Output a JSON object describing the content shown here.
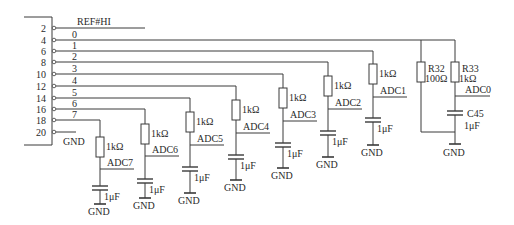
{
  "diagram": {
    "type": "circuit-schematic",
    "connector": {
      "top_label": "REF#HI",
      "pins": [
        {
          "num": "2",
          "y": 28,
          "net": "REF#HI"
        },
        {
          "num": "4",
          "y": 40,
          "net": "0"
        },
        {
          "num": "6",
          "y": 51,
          "net": "1"
        },
        {
          "num": "8",
          "y": 62,
          "net": "2"
        },
        {
          "num": "10",
          "y": 74,
          "net": "3"
        },
        {
          "num": "12",
          "y": 86,
          "net": "4"
        },
        {
          "num": "14",
          "y": 98,
          "net": "5"
        },
        {
          "num": "16",
          "y": 109,
          "net": "6"
        },
        {
          "num": "18",
          "y": 120,
          "net": "7"
        },
        {
          "num": "20",
          "y": 132,
          "net": "GND"
        }
      ],
      "gnd_label": "GND"
    },
    "channels": [
      {
        "net": "7",
        "y": 120,
        "x": 100,
        "res_top": 137,
        "res_label": "1kΩ",
        "adc_label": "ADC7",
        "node_y": 169,
        "cap_y": 186,
        "cap_label": "1μF",
        "gnd_y": 204,
        "gnd_label": "GND"
      },
      {
        "net": "6",
        "y": 109,
        "x": 145,
        "res_top": 124,
        "res_label": "1kΩ",
        "adc_label": "ADC6",
        "node_y": 156,
        "cap_y": 179,
        "cap_label": "1μF",
        "gnd_y": 198,
        "gnd_label": "GND"
      },
      {
        "net": "5",
        "y": 98,
        "x": 190,
        "res_top": 112,
        "res_label": "1kΩ",
        "adc_label": "ADC5",
        "node_y": 145,
        "cap_y": 167,
        "cap_label": "1μF",
        "gnd_y": 193,
        "gnd_label": "GND"
      },
      {
        "net": "4",
        "y": 86,
        "x": 236,
        "res_top": 100,
        "res_label": "1kΩ",
        "adc_label": "ADC4",
        "node_y": 133,
        "cap_y": 155,
        "cap_label": "1μF",
        "gnd_y": 180,
        "gnd_label": "GND"
      },
      {
        "net": "3",
        "y": 74,
        "x": 283,
        "res_top": 88,
        "res_label": "1kΩ",
        "adc_label": "ADC3",
        "node_y": 121,
        "cap_y": 143,
        "cap_label": "1μF",
        "gnd_y": 168,
        "gnd_label": "GND"
      },
      {
        "net": "2",
        "y": 62,
        "x": 328,
        "res_top": 76,
        "res_label": "1kΩ",
        "adc_label": "ADC2",
        "node_y": 109,
        "cap_y": 131,
        "cap_label": "1μF",
        "gnd_y": 157,
        "gnd_label": "GND"
      },
      {
        "net": "1",
        "y": 51,
        "x": 373,
        "res_top": 64,
        "res_label": "1kΩ",
        "adc_label": "ADC1",
        "node_y": 97,
        "cap_y": 118,
        "cap_label": "1μF",
        "gnd_y": 145,
        "gnd_label": "GND"
      }
    ],
    "channel0": {
      "net": "0",
      "y": 40,
      "r32": {
        "x": 421,
        "designator": "R32",
        "value": "100Ω"
      },
      "r33": {
        "x": 455,
        "designator": "R33",
        "value": "1kΩ"
      },
      "adc_label": "ADC0",
      "cap": {
        "designator": "C45",
        "value": "1μF"
      },
      "gnd_label": "GND"
    }
  }
}
